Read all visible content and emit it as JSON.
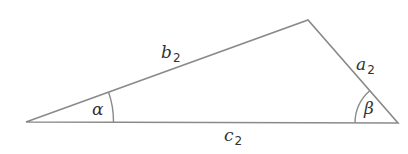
{
  "diagram": {
    "type": "triangle",
    "vertices": {
      "left": {
        "x": 26,
        "y": 122
      },
      "top": {
        "x": 308,
        "y": 20
      },
      "right": {
        "x": 398,
        "y": 123
      }
    },
    "sides": {
      "b": {
        "letter": "b",
        "subscript": "2",
        "from": "left",
        "to": "top"
      },
      "a": {
        "letter": "a",
        "subscript": "2",
        "from": "top",
        "to": "right"
      },
      "c": {
        "letter": "c",
        "subscript": "2",
        "from": "left",
        "to": "right"
      }
    },
    "angles": {
      "alpha": {
        "symbol": "α",
        "at": "left"
      },
      "beta": {
        "symbol": "β",
        "at": "right"
      }
    },
    "colors": {
      "stroke": "#8a8a8a",
      "text": "#333333"
    }
  }
}
